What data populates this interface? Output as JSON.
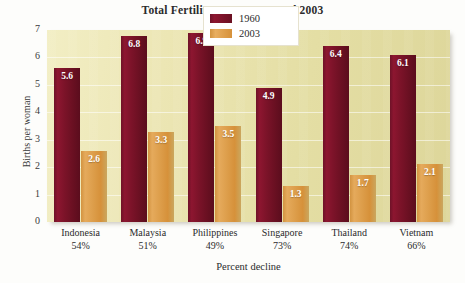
{
  "chart_data": {
    "type": "bar",
    "title": "Total Fertility Rates, 1960 and 2003",
    "xlabel": "Percent decline",
    "ylabel": "Births per woman",
    "ylim": [
      0,
      7
    ],
    "yticks": [
      "7",
      "6",
      "5",
      "4",
      "3",
      "2",
      "1",
      "0"
    ],
    "grid": true,
    "legend_position": "top-center",
    "categories": [
      "Indonesia",
      "Malaysia",
      "Philippines",
      "Singapore",
      "Thailand",
      "Vietnam"
    ],
    "category_sublabels": [
      "54%",
      "51%",
      "49%",
      "73%",
      "74%",
      "66%"
    ],
    "series": [
      {
        "name": "1960",
        "color": "#7c1329",
        "values": [
          5.6,
          6.8,
          6.9,
          4.9,
          6.4,
          6.1
        ],
        "value_labels": [
          "5.6",
          "6.8",
          "6.9",
          "4.9",
          "6.4",
          "6.1"
        ]
      },
      {
        "name": "2003",
        "color": "#d6913a",
        "values": [
          2.6,
          3.3,
          3.5,
          1.3,
          1.7,
          2.1
        ],
        "value_labels": [
          "2.6",
          "3.3",
          "3.5",
          "1.3",
          "1.7",
          "2.1"
        ]
      }
    ],
    "plot_background": "#e9e3ae",
    "page_background": "#fdfdfb"
  }
}
